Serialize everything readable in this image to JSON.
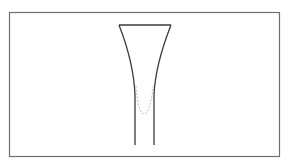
{
  "diagram": {
    "colors": {
      "background": "#ffffff",
      "frame_stroke": "#6e6e6e",
      "vessel_stroke": "#3a3a3a",
      "dashed_curve_stroke": "#b8b8b8"
    },
    "frame": {
      "x": 9,
      "y": 12,
      "width": 271,
      "height": 145
    },
    "vessel": {
      "rim_left_x": 119,
      "rim_right_x": 171,
      "rim_y": 25,
      "stem_left_x": 135,
      "stem_right_x": 154,
      "stem_bottom_y": 145
    },
    "dashed_curve": {
      "left_x": 136,
      "right_x": 153,
      "top_y": 85,
      "bottom_y": 114
    }
  }
}
